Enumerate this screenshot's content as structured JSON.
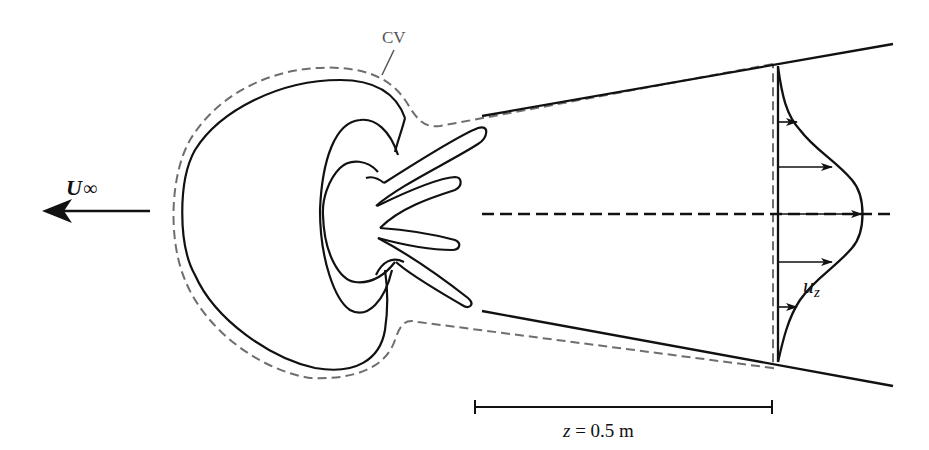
{
  "figure": {
    "type": "control-volume wake diagram",
    "free_stream_label": "U",
    "free_stream_subscript": "∞",
    "control_volume_label": "CV",
    "velocity_profile_label": "u",
    "velocity_profile_subscript": "z",
    "scale_bar": {
      "variable": "z",
      "equals": " = 0.5 m",
      "length_m": 0.5
    },
    "colors": {
      "solid_line": "#111111",
      "dashed_cv": "#6e6e6e",
      "background": "#ffffff"
    }
  }
}
